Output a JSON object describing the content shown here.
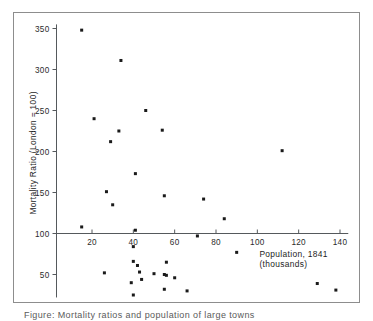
{
  "chart_data": {
    "type": "scatter",
    "title": "",
    "xlabel": "Population, 1841",
    "xlabel_line2": "(thousands)",
    "ylabel": "Mortality Ratio (London = 100)",
    "xlim": [
      0,
      145
    ],
    "ylim": [
      20,
      360
    ],
    "xticks": [
      20,
      40,
      60,
      80,
      100,
      120,
      140
    ],
    "xtick_labels": [
      "20",
      "40",
      "60",
      "80",
      "100",
      "120",
      "140"
    ],
    "yticks": [
      50,
      100,
      150,
      200,
      250,
      300,
      350
    ],
    "ytick_labels": [
      "50",
      "100",
      "150",
      "200",
      "250",
      "300",
      "350"
    ],
    "grid": false,
    "legend": null,
    "marker": "square",
    "marker_color": "#1a1a1a",
    "points": [
      {
        "x": 15,
        "y": 348
      },
      {
        "x": 34,
        "y": 311
      },
      {
        "x": 21,
        "y": 240
      },
      {
        "x": 46,
        "y": 250
      },
      {
        "x": 54,
        "y": 226
      },
      {
        "x": 33,
        "y": 225
      },
      {
        "x": 29,
        "y": 212
      },
      {
        "x": 112,
        "y": 201
      },
      {
        "x": 41,
        "y": 173
      },
      {
        "x": 27,
        "y": 151
      },
      {
        "x": 55,
        "y": 146
      },
      {
        "x": 30,
        "y": 135
      },
      {
        "x": 74,
        "y": 142
      },
      {
        "x": 84,
        "y": 118
      },
      {
        "x": 15,
        "y": 108
      },
      {
        "x": 41,
        "y": 104
      },
      {
        "x": 71,
        "y": 97
      },
      {
        "x": 40,
        "y": 84
      },
      {
        "x": 90,
        "y": 77
      },
      {
        "x": 56,
        "y": 65
      },
      {
        "x": 40,
        "y": 66
      },
      {
        "x": 42,
        "y": 61
      },
      {
        "x": 43,
        "y": 53
      },
      {
        "x": 50,
        "y": 51
      },
      {
        "x": 55,
        "y": 50
      },
      {
        "x": 56,
        "y": 49
      },
      {
        "x": 26,
        "y": 52
      },
      {
        "x": 60,
        "y": 46
      },
      {
        "x": 44,
        "y": 44
      },
      {
        "x": 39,
        "y": 40
      },
      {
        "x": 129,
        "y": 39
      },
      {
        "x": 55,
        "y": 32
      },
      {
        "x": 66,
        "y": 30
      },
      {
        "x": 138,
        "y": 31
      },
      {
        "x": 40,
        "y": 25
      }
    ]
  },
  "figure": {
    "caption_partial": "Figure: Mortality ratios and population of large towns"
  }
}
